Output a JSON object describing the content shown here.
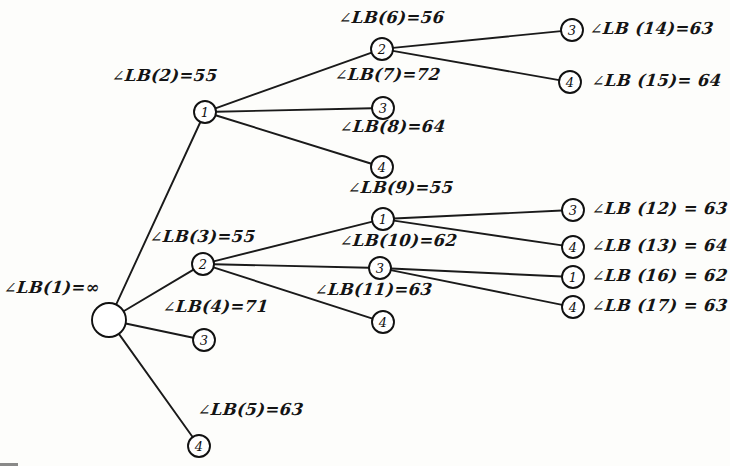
{
  "figure": {
    "angle_symbol": "∠",
    "label_prefix": "LB"
  },
  "nodes": [
    {
      "id": "n1",
      "name": "root-node",
      "label": "",
      "cx": 109,
      "cy": 320,
      "r": 17
    },
    {
      "id": "n2",
      "name": "node-lb2",
      "label": "1",
      "cx": 205,
      "cy": 112,
      "r": 11
    },
    {
      "id": "n3",
      "name": "node-lb3",
      "label": "2",
      "cx": 203,
      "cy": 264,
      "r": 11
    },
    {
      "id": "n4",
      "name": "node-lb4",
      "label": "3",
      "cx": 204,
      "cy": 340,
      "r": 11
    },
    {
      "id": "n5",
      "name": "node-lb5",
      "label": "4",
      "cx": 199,
      "cy": 446,
      "r": 11
    },
    {
      "id": "n6",
      "name": "node-lb6",
      "label": "2",
      "cx": 382,
      "cy": 49,
      "r": 11
    },
    {
      "id": "n8",
      "name": "node-lb8",
      "label": "3",
      "cx": 383,
      "cy": 108,
      "r": 11
    },
    {
      "id": "n7",
      "name": "node-lb7",
      "label": "4",
      "cx": 382,
      "cy": 167,
      "r": 11
    },
    {
      "id": "n9",
      "name": "node-lb9",
      "label": "1",
      "cx": 383,
      "cy": 219,
      "r": 11
    },
    {
      "id": "n10",
      "name": "node-lb10",
      "label": "3",
      "cx": 380,
      "cy": 268,
      "r": 11
    },
    {
      "id": "n11",
      "name": "node-lb11",
      "label": "4",
      "cx": 383,
      "cy": 322,
      "r": 11
    },
    {
      "id": "n14",
      "name": "node-lb14",
      "label": "3",
      "cx": 572,
      "cy": 30,
      "r": 11
    },
    {
      "id": "n15",
      "name": "node-lb15",
      "label": "4",
      "cx": 570,
      "cy": 82,
      "r": 11
    },
    {
      "id": "n12",
      "name": "node-lb12",
      "label": "3",
      "cx": 573,
      "cy": 210,
      "r": 11
    },
    {
      "id": "n13",
      "name": "node-lb13",
      "label": "4",
      "cx": 573,
      "cy": 247,
      "r": 11
    },
    {
      "id": "n16",
      "name": "node-lb16",
      "label": "1",
      "cx": 573,
      "cy": 277,
      "r": 11
    },
    {
      "id": "n17",
      "name": "node-lb17",
      "label": "4",
      "cx": 573,
      "cy": 307,
      "r": 11
    }
  ],
  "edges": [
    {
      "name": "edge-root-to-lb2",
      "from": "n1",
      "to": "n2"
    },
    {
      "name": "edge-root-to-lb3",
      "from": "n1",
      "to": "n3"
    },
    {
      "name": "edge-root-to-lb4",
      "from": "n1",
      "to": "n4"
    },
    {
      "name": "edge-root-to-lb5",
      "from": "n1",
      "to": "n5"
    },
    {
      "name": "edge-lb2-to-lb6",
      "from": "n2",
      "to": "n6"
    },
    {
      "name": "edge-lb2-to-lb8",
      "from": "n2",
      "to": "n8"
    },
    {
      "name": "edge-lb2-to-lb7",
      "from": "n2",
      "to": "n7"
    },
    {
      "name": "edge-lb3-to-lb9",
      "from": "n3",
      "to": "n9"
    },
    {
      "name": "edge-lb3-to-lb10",
      "from": "n3",
      "to": "n10"
    },
    {
      "name": "edge-lb3-to-lb11",
      "from": "n3",
      "to": "n11"
    },
    {
      "name": "edge-lb6-to-lb14",
      "from": "n6",
      "to": "n14"
    },
    {
      "name": "edge-lb6-to-lb15",
      "from": "n6",
      "to": "n15"
    },
    {
      "name": "edge-lb9-to-lb12",
      "from": "n9",
      "to": "n12"
    },
    {
      "name": "edge-lb9-to-lb13",
      "from": "n9",
      "to": "n13"
    },
    {
      "name": "edge-lb10-to-lb16",
      "from": "n10",
      "to": "n16"
    },
    {
      "name": "edge-lb10-to-lb17",
      "from": "n10",
      "to": "n17"
    }
  ],
  "labels": [
    {
      "name": "lb-label-1",
      "text": "LB(1)=∞",
      "x": 4,
      "y": 278
    },
    {
      "name": "lb-label-2",
      "text": "LB(2)=55",
      "x": 112,
      "y": 66
    },
    {
      "name": "lb-label-3",
      "text": "LB(3)=55",
      "x": 150,
      "y": 227
    },
    {
      "name": "lb-label-4",
      "text": "LB(4)=71",
      "x": 163,
      "y": 297
    },
    {
      "name": "lb-label-5",
      "text": "LB(5)=63",
      "x": 198,
      "y": 400
    },
    {
      "name": "lb-label-6",
      "text": "LB(6)=56",
      "x": 339,
      "y": 8
    },
    {
      "name": "lb-label-7",
      "text": "LB(7)=72",
      "x": 335,
      "y": 65
    },
    {
      "name": "lb-label-8",
      "text": "LB(8)=64",
      "x": 340,
      "y": 117
    },
    {
      "name": "lb-label-9",
      "text": "LB(9)=55",
      "x": 348,
      "y": 178
    },
    {
      "name": "lb-label-10",
      "text": "LB(10)=62",
      "x": 340,
      "y": 231
    },
    {
      "name": "lb-label-11",
      "text": "LB(11)=63",
      "x": 315,
      "y": 280
    },
    {
      "name": "lb-label-12",
      "text": "LB (12) = 63",
      "x": 592,
      "y": 199
    },
    {
      "name": "lb-label-13",
      "text": "LB (13) = 64",
      "x": 592,
      "y": 236
    },
    {
      "name": "lb-label-14",
      "text": "LB (14)=63",
      "x": 590,
      "y": 19
    },
    {
      "name": "lb-label-15",
      "text": "LB (15)= 64",
      "x": 592,
      "y": 71
    },
    {
      "name": "lb-label-16",
      "text": "LB (16) = 62",
      "x": 592,
      "y": 266
    },
    {
      "name": "lb-label-17",
      "text": "LB (17) = 63",
      "x": 592,
      "y": 296
    }
  ],
  "colors": {
    "ink": "#141414",
    "paper": "#fdfdfb"
  }
}
